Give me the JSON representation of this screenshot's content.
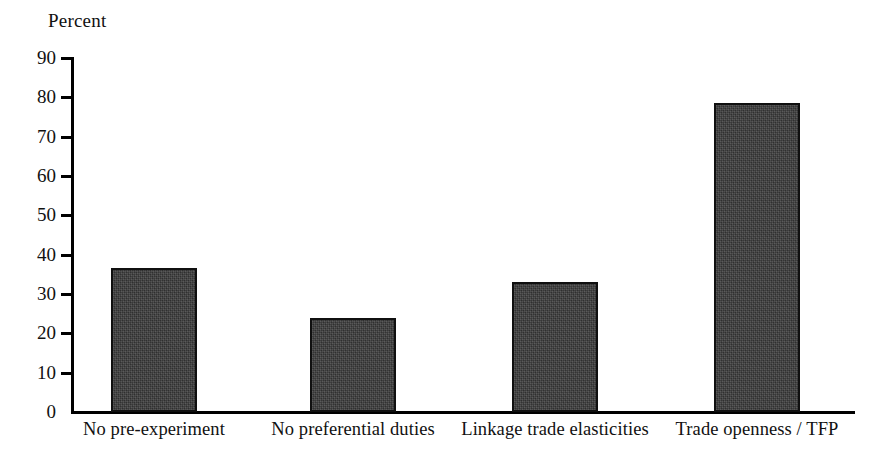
{
  "chart_data": {
    "type": "bar",
    "title": "",
    "subtitle": "",
    "xlabel": "",
    "ylabel": "Percent",
    "ylim": [
      0,
      90
    ],
    "grid": false,
    "legend": false,
    "legend_position": "none",
    "bar_color": "#3c3c3c",
    "bar_edge_color": "#101010",
    "axis_color": "#000000",
    "categories": [
      "No pre-experiment",
      "No preferential duties",
      "Linkage trade elasticities",
      "Trade openness / TFP"
    ],
    "values": [
      36.5,
      23.8,
      33.0,
      78.5
    ],
    "y_ticks": [
      0,
      10,
      20,
      30,
      40,
      50,
      60,
      70,
      80,
      90
    ],
    "y_tick_labels": [
      "0",
      "10",
      "20",
      "30",
      "40",
      "50",
      "60",
      "70",
      "80",
      "90"
    ]
  },
  "axis": {
    "y_title": "Percent"
  },
  "ticks": {
    "t0": "0",
    "t1": "10",
    "t2": "20",
    "t3": "30",
    "t4": "40",
    "t5": "50",
    "t6": "60",
    "t7": "70",
    "t8": "80",
    "t9": "90"
  },
  "categories": {
    "c0": "No pre-experiment",
    "c1": "No preferential duties",
    "c2": "Linkage trade elasticities",
    "c3": "Trade openness / TFP"
  }
}
